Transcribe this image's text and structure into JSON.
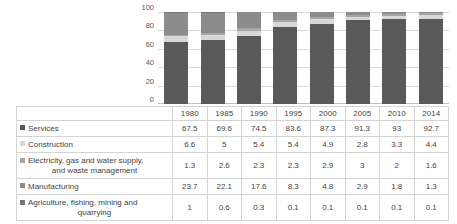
{
  "chart_data": {
    "type": "bar",
    "subtype": "100% stacked column",
    "title": "",
    "xlabel": "",
    "ylabel": "",
    "ylim": [
      0,
      100
    ],
    "yticks": [
      "0",
      "20",
      "40",
      "60",
      "80",
      "100"
    ],
    "grid": true,
    "legend_position": "table-first-column",
    "categories": [
      "1980",
      "1985",
      "1990",
      "1995",
      "2000",
      "2005",
      "2010",
      "2014"
    ],
    "series": [
      {
        "name": "Services",
        "color": "#595959",
        "values": [
          67.5,
          69.6,
          74.5,
          83.6,
          87.3,
          91.3,
          93,
          92.7
        ],
        "labels": [
          "67.5",
          "69.6",
          "74.5",
          "83.6",
          "87.3",
          "91.3",
          "93",
          "92.7"
        ]
      },
      {
        "name": "Construction",
        "color": "#d8d8d8",
        "values": [
          6.6,
          5,
          5.4,
          5.4,
          4.9,
          2.8,
          3.3,
          4.4
        ],
        "labels": [
          "6.6",
          "5",
          "5.4",
          "5.4",
          "4.9",
          "2.8",
          "3.3",
          "4.4"
        ]
      },
      {
        "name": "Electricity, gas and water supply, and waste management",
        "color": "#a6a6a6",
        "values": [
          1.3,
          2.6,
          2.3,
          2.3,
          2.9,
          3,
          2,
          1.6
        ],
        "labels": [
          "1.3",
          "2.6",
          "2.3",
          "2.3",
          "2.9",
          "3",
          "2",
          "1.6"
        ]
      },
      {
        "name": "Manufacturing",
        "color": "#8c8c8c",
        "values": [
          23.7,
          22.1,
          17.6,
          8.3,
          4.8,
          2.9,
          1.8,
          1.3
        ],
        "labels": [
          "23.7",
          "22.1",
          "17.6",
          "8.3",
          "4.8",
          "2.9",
          "1.8",
          "1.3"
        ]
      },
      {
        "name": "Agriculture, fishing, mining and quarrying",
        "color": "#767676",
        "values": [
          1,
          0.6,
          0.3,
          0.1,
          0.1,
          0.1,
          0.1,
          0.1
        ],
        "labels": [
          "1",
          "0.6",
          "0.3",
          "0.1",
          "0.1",
          "0.1",
          "0.1",
          "0.1"
        ]
      }
    ]
  },
  "table": {
    "header": [
      "1980",
      "1985",
      "1990",
      "1995",
      "2000",
      "2005",
      "2010",
      "2014"
    ],
    "rows": [
      {
        "label": "Services",
        "label_line1": "Services",
        "label_line2": "",
        "swatch": "#595959",
        "values": [
          "67.5",
          "69.6",
          "74.5",
          "83.6",
          "87.3",
          "91.3",
          "93",
          "92.7"
        ]
      },
      {
        "label": "Construction",
        "label_line1": "Construction",
        "label_line2": "",
        "swatch": "#d8d8d8",
        "values": [
          "6.6",
          "5",
          "5.4",
          "5.4",
          "4.9",
          "2.8",
          "3.3",
          "4.4"
        ]
      },
      {
        "label": "Electricity, gas and water supply, and waste management",
        "label_line1": "Electricity, gas and water supply,",
        "label_line2": "and waste management",
        "swatch": "#a6a6a6",
        "values": [
          "1.3",
          "2.6",
          "2.3",
          "2.3",
          "2.9",
          "3",
          "2",
          "1.6"
        ]
      },
      {
        "label": "Manufacturing",
        "label_line1": "Manufacturing",
        "label_line2": "",
        "swatch": "#8c8c8c",
        "values": [
          "23.7",
          "22.1",
          "17.6",
          "8.3",
          "4.8",
          "2.9",
          "1.8",
          "1.3"
        ]
      },
      {
        "label": "Agriculture, fishing, mining and quarrying",
        "label_line1": "Agriculture, fishing, mining and",
        "label_line2": "quarrying",
        "swatch": "#767676",
        "values": [
          "1",
          "0.6",
          "0.3",
          "0.1",
          "0.1",
          "0.1",
          "0.1",
          "0.1"
        ]
      }
    ]
  }
}
